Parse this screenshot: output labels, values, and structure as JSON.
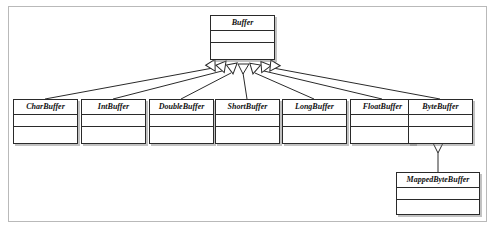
{
  "diagram": {
    "type": "uml-class-diagram",
    "relationship": "generalization",
    "colors": {
      "frame_border": "#b9b9b9",
      "box_border": "#2a2a2a",
      "box_fill": "#ffffff",
      "line": "#2a2a2a",
      "shadow": "#787878",
      "text": "#111111"
    }
  },
  "classes": {
    "root": {
      "name": "Buffer"
    },
    "subclasses": [
      {
        "name": "CharBuffer"
      },
      {
        "name": "IntBuffer"
      },
      {
        "name": "DoubleBuffer"
      },
      {
        "name": "ShortBuffer"
      },
      {
        "name": "LongBuffer"
      },
      {
        "name": "FloatBuffer"
      },
      {
        "name": "ByteBuffer"
      }
    ],
    "leaf": {
      "name": "MappedByteBuffer"
    }
  }
}
